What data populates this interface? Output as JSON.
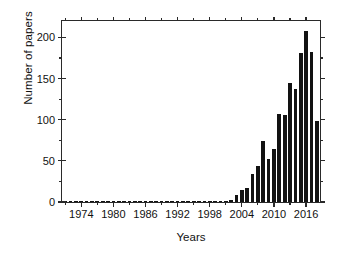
{
  "chart_data": {
    "type": "bar",
    "title": "",
    "xlabel": "Years",
    "ylabel": "Number of papers",
    "xlim": [
      1970.4,
      2018.6
    ],
    "ylim": [
      0,
      220
    ],
    "grid": false,
    "legend": null,
    "y_ticks": [
      0,
      50,
      100,
      150,
      200
    ],
    "y_tick_labels": [
      "0",
      "50",
      "100",
      "150",
      "200"
    ],
    "y_minor_ticks": [
      25,
      75,
      125,
      175
    ],
    "x_ticks": [
      1974,
      1980,
      1986,
      1992,
      1998,
      2004,
      2010,
      2016
    ],
    "x_tick_labels": [
      "1974",
      "1980",
      "1986",
      "1992",
      "1998",
      "2004",
      "2010",
      "2016"
    ],
    "x_minor_ticks": [
      1971,
      1977,
      1983,
      1989,
      1995,
      2001,
      2007,
      2013
    ],
    "bar_color": "#121212",
    "axis_color": "#2a2a2a",
    "background": "#ffffff",
    "categories": [
      1971,
      1972,
      1973,
      1974,
      1975,
      1976,
      1977,
      1978,
      1979,
      1980,
      1981,
      1982,
      1983,
      1984,
      1985,
      1986,
      1987,
      1988,
      1989,
      1990,
      1991,
      1992,
      1993,
      1994,
      1995,
      1996,
      1997,
      1998,
      1999,
      2000,
      2001,
      2002,
      2003,
      2004,
      2005,
      2006,
      2007,
      2008,
      2009,
      2010,
      2011,
      2012,
      2013,
      2014,
      2015,
      2016,
      2017,
      2018
    ],
    "values": [
      1,
      0,
      0,
      0,
      0,
      0,
      1,
      0,
      1,
      1,
      0,
      0,
      1,
      1,
      1,
      0,
      0,
      1,
      1,
      1,
      0,
      0,
      0,
      0,
      1,
      1,
      1,
      1,
      1,
      1,
      1,
      2,
      9,
      14,
      17,
      34,
      44,
      74,
      52,
      65,
      107,
      106,
      145,
      137,
      181,
      208,
      182,
      98
    ],
    "series_name": "Number of papers"
  },
  "axes": {
    "ylabel": "Number of papers",
    "xlabel": "Years"
  }
}
